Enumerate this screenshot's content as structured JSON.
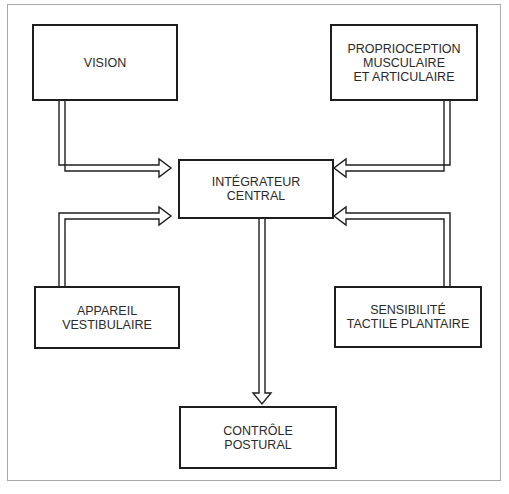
{
  "diagram": {
    "nodes": {
      "vision": {
        "lines": [
          "VISION"
        ]
      },
      "proprioception": {
        "lines": [
          "PROPRIOCEPTION",
          "MUSCULAIRE",
          "ET ARTICULAIRE"
        ]
      },
      "integrateur": {
        "lines": [
          "INTÉGRATEUR",
          "CENTRAL"
        ]
      },
      "vestibulaire": {
        "lines": [
          "APPAREIL",
          "VESTIBULAIRE"
        ]
      },
      "plantaire": {
        "lines": [
          "SENSIBILITÉ",
          "TACTILE PLANTAIRE"
        ]
      },
      "controle": {
        "lines": [
          "CONTRÔLE",
          "POSTURAL"
        ]
      }
    },
    "edges": [
      {
        "from": "VISION",
        "to": "INTÉGRATEUR CENTRAL"
      },
      {
        "from": "PROPRIOCEPTION MUSCULAIRE ET ARTICULAIRE",
        "to": "INTÉGRATEUR CENTRAL"
      },
      {
        "from": "APPAREIL VESTIBULAIRE",
        "to": "INTÉGRATEUR CENTRAL"
      },
      {
        "from": "SENSIBILITÉ TACTILE PLANTAIRE",
        "to": "INTÉGRATEUR CENTRAL"
      },
      {
        "from": "INTÉGRATEUR CENTRAL",
        "to": "CONTRÔLE POSTURAL"
      }
    ],
    "colors": {
      "line": "#1e1e1e",
      "text": "#2a2a2a",
      "frame": "#a9a9a9",
      "background": "#ffffff"
    }
  }
}
